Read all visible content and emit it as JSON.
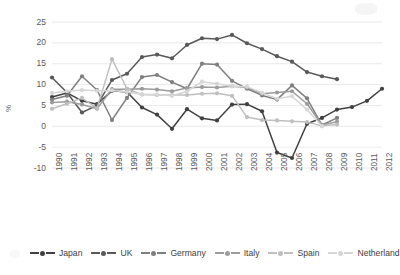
{
  "chart_data": {
    "type": "line",
    "title": "",
    "xlabel": "",
    "ylabel": "%",
    "ylim": [
      -10,
      25
    ],
    "ytick_step": 5,
    "yticks": [
      "25",
      "20",
      "15",
      "10",
      "5",
      "0",
      "-5",
      "-10"
    ],
    "grid": "horizontal",
    "legend_position": "bottom",
    "categories": [
      "1990",
      "1991",
      "1992",
      "1993",
      "1994",
      "1995",
      "1996",
      "1997",
      "1998",
      "1999",
      "2000",
      "2001",
      "2002",
      "2003",
      "2004",
      "2005",
      "2006",
      "2007",
      "2008",
      "2009",
      "2010",
      "2011",
      "2012"
    ],
    "series": [
      {
        "name": "Japan",
        "color": "#404040",
        "values": [
          7.0,
          8.0,
          6.1,
          5.3,
          8.5,
          8.2,
          4.5,
          2.8,
          -0.6,
          4.1,
          1.9,
          1.4,
          5.2,
          5.3,
          3.6,
          -6.3,
          -7.6,
          0.6,
          2.0,
          4.0,
          4.6,
          6.1,
          9.0
        ]
      },
      {
        "name": "UK",
        "color": "#595959",
        "values": [
          11.7,
          8.1,
          3.3,
          5.0,
          11.1,
          12.6,
          16.6,
          17.2,
          16.3,
          19.5,
          21.1,
          20.9,
          21.9,
          19.9,
          18.5,
          16.8,
          15.5,
          13.0,
          12.0,
          11.3,
          null,
          null,
          null
        ]
      },
      {
        "name": "Germany",
        "color": "#7f7f7f",
        "values": [
          6.4,
          7.3,
          12.0,
          8.7,
          1.5,
          6.8,
          11.8,
          12.3,
          10.6,
          9.0,
          15.0,
          14.8,
          10.9,
          9.0,
          7.4,
          6.4,
          9.8,
          6.7,
          0.3,
          2.0,
          null,
          null,
          null
        ]
      },
      {
        "name": "Italy",
        "color": "#9c9c9c",
        "values": [
          5.7,
          5.9,
          5.2,
          4.2,
          8.9,
          8.9,
          9.0,
          8.8,
          8.4,
          9.2,
          9.4,
          9.3,
          9.6,
          9.3,
          7.8,
          8.1,
          8.4,
          5.4,
          0.3,
          1.1,
          null,
          null,
          null
        ]
      },
      {
        "name": "Spain",
        "color": "#bfbfbf",
        "values": [
          4.2,
          5.4,
          6.8,
          4.3,
          16.1,
          9.0,
          7.6,
          7.5,
          7.5,
          7.5,
          7.8,
          7.9,
          7.3,
          2.2,
          1.5,
          1.4,
          1.2,
          1.0,
          0.1,
          0.4,
          null,
          null,
          null
        ]
      },
      {
        "name": "Netherland",
        "color": "#d6d6d6",
        "values": [
          8.0,
          8.4,
          8.7,
          8.5,
          8.6,
          8.2,
          7.7,
          7.6,
          7.3,
          8.4,
          10.7,
          10.2,
          9.6,
          9.5,
          8.0,
          6.6,
          7.2,
          4.0,
          0.0,
          null,
          null,
          null,
          null
        ]
      }
    ]
  },
  "legend": {
    "items": [
      {
        "label": "Japan"
      },
      {
        "label": "UK"
      },
      {
        "label": "Germany"
      },
      {
        "label": "Italy"
      },
      {
        "label": "Spain"
      },
      {
        "label": "Netherland"
      }
    ]
  }
}
